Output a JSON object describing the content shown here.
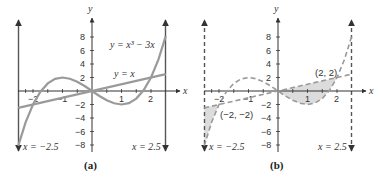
{
  "panels": [
    {
      "id": "a",
      "caption": "(a)",
      "x_axis_label": "x",
      "y_axis_label": "y",
      "x_ticks": [
        "−2",
        "−1",
        "1",
        "2"
      ],
      "y_ticks": [
        "8",
        "6",
        "4",
        "2",
        "−2",
        "−4",
        "−6",
        "−8"
      ],
      "curve_labels": {
        "cubic": "y = x³ − 3x",
        "line": "y = x"
      },
      "boundary_labels": {
        "left": "x = −2.5",
        "right": "x = 2.5"
      }
    },
    {
      "id": "b",
      "caption": "(b)",
      "x_axis_label": "x",
      "y_axis_label": "y",
      "x_ticks": [
        "−2",
        "−1",
        "1",
        "2"
      ],
      "y_ticks": [
        "8",
        "6",
        "4",
        "2",
        "−2",
        "−4",
        "−6",
        "−8"
      ],
      "point_labels": {
        "upper": "(2, 2)",
        "lower": "(−2, −2)"
      },
      "boundary_labels": {
        "left": "x = −2.5",
        "right": "x = 2.5"
      }
    }
  ],
  "colors": {
    "axis": "#333333",
    "curve": "#9a9a9a",
    "shade": "#dcdcdc"
  }
}
